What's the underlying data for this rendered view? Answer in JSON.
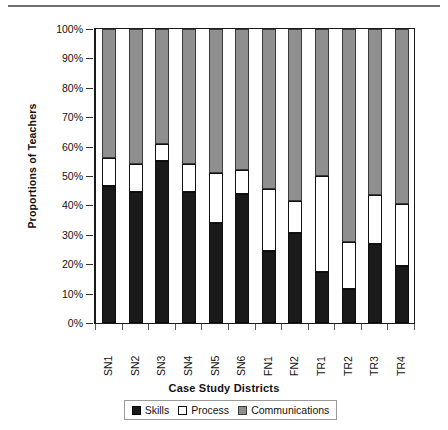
{
  "chart_data": {
    "type": "bar",
    "subtype": "stacked-percent",
    "title": "",
    "xlabel": "Case Study Districts",
    "ylabel": "Proportions of Teachers",
    "ylim": [
      0,
      100
    ],
    "ytick_labels": [
      "100%",
      "90%",
      "80%",
      "70%",
      "60%",
      "50%",
      "40%",
      "30%",
      "20%",
      "10%",
      "0%"
    ],
    "ytick_values": [
      100,
      90,
      80,
      70,
      60,
      50,
      40,
      30,
      20,
      10,
      0
    ],
    "grid": false,
    "legend_position": "bottom",
    "categories": [
      "SN1",
      "SN2",
      "SN3",
      "SN4",
      "SN5",
      "SN6",
      "FN1",
      "FN2",
      "TR1",
      "TR2",
      "TR3",
      "TR4"
    ],
    "series": [
      {
        "name": "Skills",
        "color": "#1a1a1a",
        "values": [
          46.5,
          44.5,
          55.0,
          44.5,
          34.0,
          44.0,
          24.5,
          30.5,
          17.5,
          11.5,
          27.0,
          19.5
        ]
      },
      {
        "name": "Process",
        "color": "#ffffff",
        "values": [
          9.5,
          9.5,
          6.0,
          9.5,
          17.0,
          8.0,
          21.0,
          11.0,
          32.5,
          16.0,
          16.5,
          21.0
        ]
      },
      {
        "name": "Communications",
        "color": "#8f8f8f",
        "values": [
          44.0,
          46.0,
          39.0,
          46.0,
          49.0,
          48.0,
          54.5,
          58.5,
          50.0,
          72.5,
          56.5,
          59.5
        ]
      }
    ],
    "cumulative_tops": {
      "skills": [
        46.5,
        44.5,
        55.0,
        44.5,
        34.0,
        44.0,
        24.5,
        30.5,
        17.5,
        11.5,
        27.0,
        19.5
      ],
      "process": [
        56.0,
        54.0,
        61.0,
        54.0,
        51.0,
        52.0,
        45.5,
        41.5,
        50.0,
        27.5,
        43.5,
        40.5
      ],
      "communications": [
        100,
        100,
        100,
        100,
        100,
        100,
        100,
        100,
        100,
        100,
        100,
        100
      ]
    }
  },
  "legend": {
    "items": [
      {
        "label": "Skills",
        "key": "skills"
      },
      {
        "label": "Process",
        "key": "process"
      },
      {
        "label": "Communications",
        "key": "comms"
      }
    ]
  }
}
